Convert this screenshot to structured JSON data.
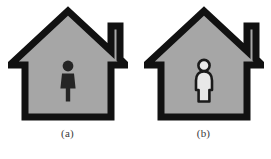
{
  "figure": {
    "background_color": "#ffffff",
    "panels": [
      {
        "id": "panel-a",
        "caption": "(a)",
        "house": {
          "icon_name": "house-icon",
          "fill_color": "#a6a6a6",
          "outline_color": "#111111",
          "has_chimney": true
        },
        "occupant": {
          "icon_name": "male-person-icon",
          "label": "male figure",
          "fill_color": "#252525",
          "outline_color": "#252525",
          "style": "solid-dark-silhouette"
        }
      },
      {
        "id": "panel-b",
        "caption": "(b)",
        "house": {
          "icon_name": "house-icon",
          "fill_color": "#a6a6a6",
          "outline_color": "#111111",
          "has_chimney": true
        },
        "occupant": {
          "icon_name": "female-person-icon",
          "label": "female figure",
          "fill_color": "#e8e8e8",
          "outline_color": "#1a1a1a",
          "style": "light-fill-dark-outline"
        }
      }
    ]
  }
}
